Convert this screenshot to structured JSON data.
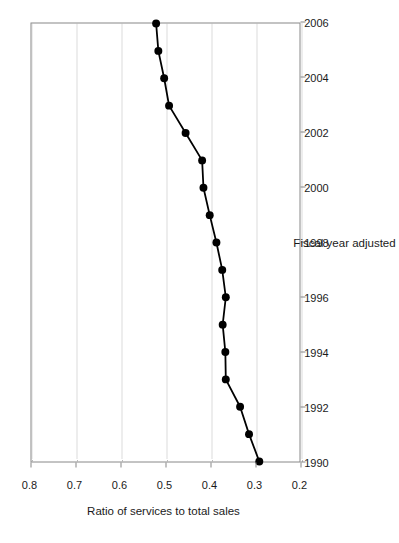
{
  "chart_data": {
    "type": "line",
    "title": "",
    "xlabel": "Fiscal year adjusted",
    "ylabel": "Ratio of services to total sales",
    "xlim": [
      1990,
      2006
    ],
    "ylim": [
      0.2,
      0.8
    ],
    "grid": true,
    "legend": null,
    "orientation": "rotated-90-ccw",
    "marker": "filled-circle",
    "line_color": "#000000",
    "grid_color": "#b9b9b9",
    "axis_color": "#888888",
    "x_ticks": [
      1990,
      1992,
      1994,
      1996,
      1998,
      2000,
      2002,
      2004,
      2006
    ],
    "x_tick_labels": [
      "1990",
      "1992",
      "1994",
      "1996",
      "1998",
      "2000",
      "2002",
      "2004",
      "2006"
    ],
    "y_ticks": [
      0.2,
      0.3,
      0.4,
      0.5,
      0.6,
      0.7,
      0.8
    ],
    "y_tick_labels": [
      "0.2",
      "0.3",
      "0.4",
      "0.5",
      "0.6",
      "0.7",
      "0.8"
    ],
    "x": [
      1990,
      1991,
      1992,
      1993,
      1994,
      1995,
      1996,
      1997,
      1998,
      1999,
      2000,
      2001,
      2002,
      2003,
      2004,
      2005,
      2006
    ],
    "values": [
      0.29,
      0.313,
      0.333,
      0.365,
      0.366,
      0.372,
      0.365,
      0.373,
      0.386,
      0.401,
      0.415,
      0.418,
      0.455,
      0.492,
      0.503,
      0.516,
      0.521
    ],
    "series": [
      {
        "name": "Ratio of services to total sales",
        "values": [
          0.29,
          0.313,
          0.333,
          0.365,
          0.366,
          0.372,
          0.365,
          0.373,
          0.386,
          0.401,
          0.415,
          0.418,
          0.455,
          0.492,
          0.503,
          0.516,
          0.521
        ]
      }
    ]
  }
}
